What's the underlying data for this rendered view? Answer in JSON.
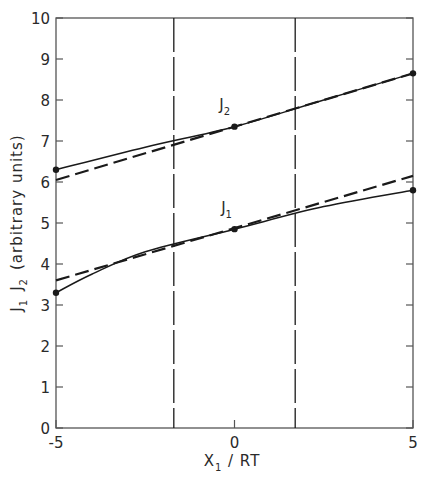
{
  "chart_data": {
    "type": "line",
    "title": "",
    "xlabel": "X₁ / RT",
    "xlabel_parts": {
      "main": "X",
      "sub": "1",
      "rest": " / RT"
    },
    "ylabel": "J₁  J₂  (arbitrary units)",
    "ylabel_parts": {
      "j1": "J",
      "j1_sub": "1",
      "j2": "J",
      "j2_sub": "2",
      "rest": "(arbitrary units)"
    },
    "xlim": [
      -5,
      5
    ],
    "ylim": [
      0,
      10
    ],
    "x_ticks": [
      -5,
      0,
      5
    ],
    "x_tick_labels": [
      "-5",
      "0",
      "5"
    ],
    "y_ticks": [
      0,
      1,
      2,
      3,
      4,
      5,
      6,
      7,
      8,
      9,
      10
    ],
    "y_tick_labels": [
      "0",
      "1",
      "2",
      "3",
      "4",
      "5",
      "6",
      "7",
      "8",
      "9",
      "10"
    ],
    "grid": false,
    "legend": "none (curves labelled inline)",
    "vertical_reference_lines": [
      {
        "x": -1.7,
        "style": "dashed"
      },
      {
        "x": 1.7,
        "style": "dashed"
      }
    ],
    "series": [
      {
        "name": "J2 (exact)",
        "style": "solid",
        "x": [
          -5,
          -2.5,
          0,
          2.5,
          5
        ],
        "values": [
          6.3,
          6.85,
          7.35,
          8.0,
          8.65
        ],
        "markers_at": [
          -5,
          0,
          5
        ]
      },
      {
        "name": "J2 (linear approximation)",
        "style": "dashed",
        "x": [
          -5,
          5
        ],
        "values": [
          6.05,
          8.65
        ]
      },
      {
        "name": "J1 (exact)",
        "style": "solid",
        "x": [
          -5,
          -4,
          -2.5,
          0,
          2.5,
          5
        ],
        "values": [
          3.3,
          3.75,
          4.3,
          4.85,
          5.4,
          5.8
        ],
        "markers_at": [
          -5,
          0,
          5
        ]
      },
      {
        "name": "J1 (linear approximation)",
        "style": "dashed",
        "x": [
          -5,
          5
        ],
        "values": [
          3.6,
          6.15
        ]
      }
    ],
    "annotations": [
      {
        "text": "J₂",
        "main": "J",
        "sub": "2",
        "x": -0.2,
        "y": 7.75
      },
      {
        "text": "J₁",
        "main": "J",
        "sub": "1",
        "x": -0.15,
        "y": 5.25
      }
    ]
  },
  "style": {
    "line_color": "#1a1a1a",
    "axis_color": "#555555",
    "background": "#ffffff"
  }
}
